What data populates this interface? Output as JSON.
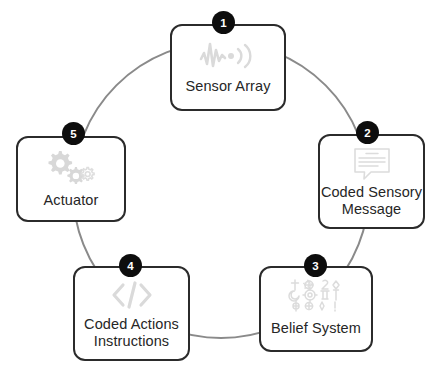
{
  "diagram": {
    "type": "cycle",
    "background_color": "#ffffff",
    "node_border_color": "#2b2b2b",
    "badge_color": "#0d0d0d",
    "badge_text_color": "#ffffff",
    "arc_color": "#8a8a8a",
    "icon_color": "#d8d8d8",
    "label_color": "#262626",
    "nodes": [
      {
        "number": "1",
        "label": "Sensor Array",
        "icon": "signal-waveform-icon"
      },
      {
        "number": "2",
        "label": "Coded Sensory Message",
        "label_line_1": "Coded Sensory",
        "label_line_2": "Message",
        "icon": "speech-bubble-text-icon"
      },
      {
        "number": "3",
        "label": "Belief System",
        "icon": "religious-symbols-grid-icon"
      },
      {
        "number": "4",
        "label": "Coded Actions Instructions",
        "label_line_1": "Coded Actions",
        "label_line_2": "Instructions",
        "icon": "code-brackets-icon"
      },
      {
        "number": "5",
        "label": "Actuator",
        "icon": "gears-icon"
      }
    ]
  }
}
